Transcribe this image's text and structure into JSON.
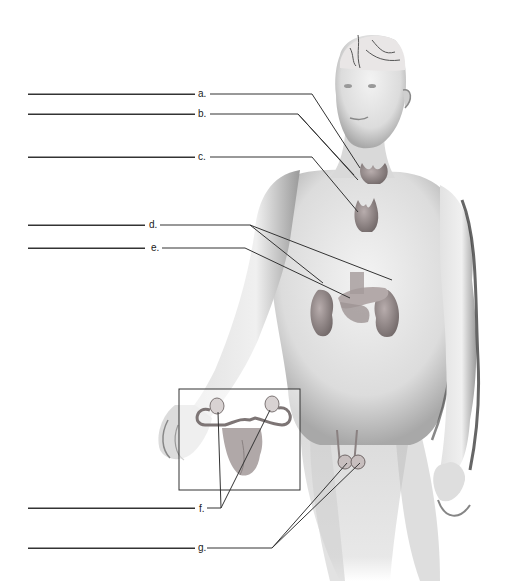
{
  "diagram": {
    "type": "anatomical-labeling",
    "labels": [
      {
        "letter": "a.",
        "y": 94,
        "organ_hint": "pituitary/hypothalamus region"
      },
      {
        "letter": "b.",
        "y": 114,
        "organ_hint": "thyroid/parathyroid"
      },
      {
        "letter": "c.",
        "y": 157,
        "organ_hint": "thymus"
      },
      {
        "letter": "d.",
        "y": 225,
        "organ_hint": "adrenal glands"
      },
      {
        "letter": "e.",
        "y": 248,
        "organ_hint": "pancreas"
      },
      {
        "letter": "f.",
        "y": 508,
        "organ_hint": "ovaries"
      },
      {
        "letter": "g.",
        "y": 548,
        "organ_hint": "testes"
      }
    ],
    "colors": {
      "line": "#333333",
      "skin_light": "#ececec",
      "skin_mid": "#cfcfcf",
      "skin_dark": "#8a8a8a",
      "organ": "#9a8f8f",
      "inset_border": "#333333"
    }
  }
}
